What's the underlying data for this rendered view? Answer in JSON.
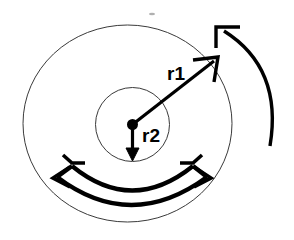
{
  "figure": {
    "background_color": "#ffffff",
    "stroke_color": "#000000",
    "thin_stroke_color": "#3a3a3a",
    "artifact_color": "#b0b0b0"
  },
  "labels": {
    "r1": "r1",
    "r2": "r2"
  },
  "shapes": {
    "outer_ellipse": {
      "name": "outer-ellipse",
      "cx": 127.5,
      "cy": 123.5,
      "rx": 104.5,
      "ry": 98.5,
      "stroke_width": 1
    },
    "inner_circle": {
      "name": "inner-circle",
      "cx": 132.5,
      "cy": 124.5,
      "r": 37,
      "stroke_width": 1
    },
    "center_dot": {
      "name": "center-dot",
      "cx": 132.5,
      "cy": 124.5,
      "r": 5.5
    },
    "r1_arrow": {
      "name": "r1-radius-arrow",
      "x1": 132.5,
      "y1": 124.5,
      "x2": 216,
      "y2": 60,
      "stroke_width": 3.2
    },
    "r2_arrow": {
      "name": "r2-radius-arrow",
      "x1": 132.5,
      "y1": 124.5,
      "x2": 132.5,
      "y2": 158,
      "stroke_width": 3.2
    },
    "bottom_arc_outer": {
      "name": "bottom-outer-arc",
      "stroke_width": 4
    },
    "bottom_arc_inner": {
      "name": "bottom-inner-arc",
      "stroke_width": 4
    },
    "rotation_arc": {
      "name": "rotation-arc",
      "stroke_width": 3.4
    }
  },
  "label_positions": {
    "r1": {
      "x": 167,
      "y": 80,
      "font_size": 19
    },
    "r2": {
      "x": 142,
      "y": 142,
      "font_size": 19
    }
  },
  "artifact": {
    "name": "speck-artifact",
    "cx": 152,
    "cy": 14,
    "rx": 3,
    "ry": 1.2
  }
}
